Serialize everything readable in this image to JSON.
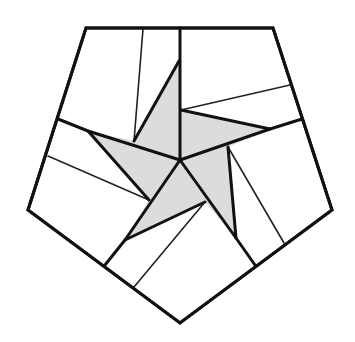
{
  "diagram": {
    "title": "",
    "colors": {
      "background": "#ffffff",
      "stroke": "#111111",
      "thin_stroke": "#222222",
      "star_fill": "#dcdcdc"
    },
    "pentagon": [
      [
        86,
        28
      ],
      [
        273,
        28
      ],
      [
        332,
        210
      ],
      [
        180,
        323
      ],
      [
        28,
        210
      ]
    ],
    "center": [
      180,
      160
    ],
    "star_polygon": [
      [
        179,
        61
      ],
      [
        181,
        110
      ],
      [
        270,
        129
      ],
      [
        228,
        147
      ],
      [
        236,
        238
      ],
      [
        205,
        202
      ],
      [
        125,
        240
      ],
      [
        149,
        200
      ],
      [
        88,
        131
      ],
      [
        134,
        141
      ]
    ],
    "thick_lines": [
      [
        [
          180,
          28
        ],
        [
          180,
          160
        ]
      ],
      [
        [
          58,
          119
        ],
        [
          88,
          131
        ],
        [
          180,
          160
        ]
      ],
      [
        [
          180,
          160
        ],
        [
          270,
          129
        ],
        [
          302,
          119
        ]
      ],
      [
        [
          180,
          160
        ],
        [
          236,
          238
        ],
        [
          255,
          265
        ]
      ],
      [
        [
          180,
          160
        ],
        [
          125,
          240
        ],
        [
          105,
          265
        ]
      ],
      [
        [
          179,
          61
        ],
        [
          134,
          141
        ]
      ],
      [
        [
          88,
          131
        ],
        [
          149,
          200
        ]
      ],
      [
        [
          125,
          240
        ],
        [
          205,
          202
        ]
      ],
      [
        [
          236,
          238
        ],
        [
          228,
          147
        ]
      ],
      [
        [
          270,
          129
        ],
        [
          181,
          110
        ]
      ]
    ],
    "thin_lines": [
      [
        [
          143,
          29
        ],
        [
          134,
          141
        ]
      ],
      [
        [
          290,
          85
        ],
        [
          181,
          110
        ]
      ],
      [
        [
          284,
          243
        ],
        [
          228,
          147
        ]
      ],
      [
        [
          134,
          287
        ],
        [
          205,
          202
        ]
      ],
      [
        [
          48,
          156
        ],
        [
          149,
          200
        ]
      ]
    ]
  }
}
